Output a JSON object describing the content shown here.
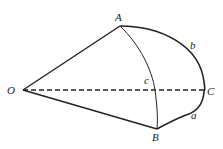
{
  "diagram": {
    "type": "spherical-triangle",
    "points": {
      "O": {
        "label": "O",
        "x": 23,
        "y": 90
      },
      "A": {
        "label": "A",
        "x": 120,
        "y": 26
      },
      "B": {
        "label": "B",
        "x": 157,
        "y": 129
      },
      "C": {
        "label": "C",
        "x": 204,
        "y": 90
      }
    },
    "arc_labels": {
      "a": "a",
      "b": "b",
      "c": "c"
    },
    "segments": [
      {
        "from": "O",
        "to": "A",
        "style": "solid"
      },
      {
        "from": "O",
        "to": "B",
        "style": "solid"
      },
      {
        "from": "O",
        "to": "C",
        "style": "dashed"
      }
    ],
    "arcs": [
      {
        "name": "b",
        "from": "A",
        "to": "C",
        "style": "solid-bold"
      },
      {
        "name": "a",
        "from": "C",
        "to": "B",
        "style": "solid-bold"
      },
      {
        "name": "c",
        "from": "A",
        "to": "B",
        "style": "solid-thin"
      }
    ],
    "colors": {
      "stroke": "#222222",
      "background": "#ffffff"
    }
  }
}
